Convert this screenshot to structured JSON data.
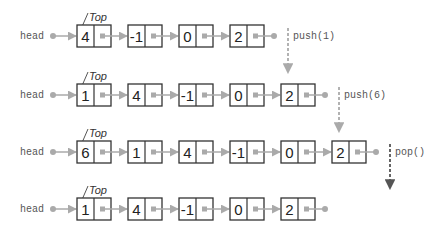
{
  "diagram": {
    "head_label": "head",
    "top_label": "Top",
    "colors": {
      "box_stroke": "#333333",
      "pointer": "#aaaaaa",
      "push_arrow": "#aaaaaa",
      "pop_arrow": "#555555"
    },
    "rows": [
      {
        "values": [
          "4",
          "-1",
          "0",
          "2"
        ]
      },
      {
        "values": [
          "1",
          "4",
          "-1",
          "0",
          "2"
        ]
      },
      {
        "values": [
          "6",
          "1",
          "4",
          "-1",
          "0",
          "2"
        ]
      },
      {
        "values": [
          "1",
          "4",
          "-1",
          "0",
          "2"
        ]
      }
    ],
    "operations": [
      {
        "label": "push(1)",
        "type": "push"
      },
      {
        "label": "push(6)",
        "type": "push"
      },
      {
        "label": "pop()",
        "type": "pop"
      }
    ]
  }
}
